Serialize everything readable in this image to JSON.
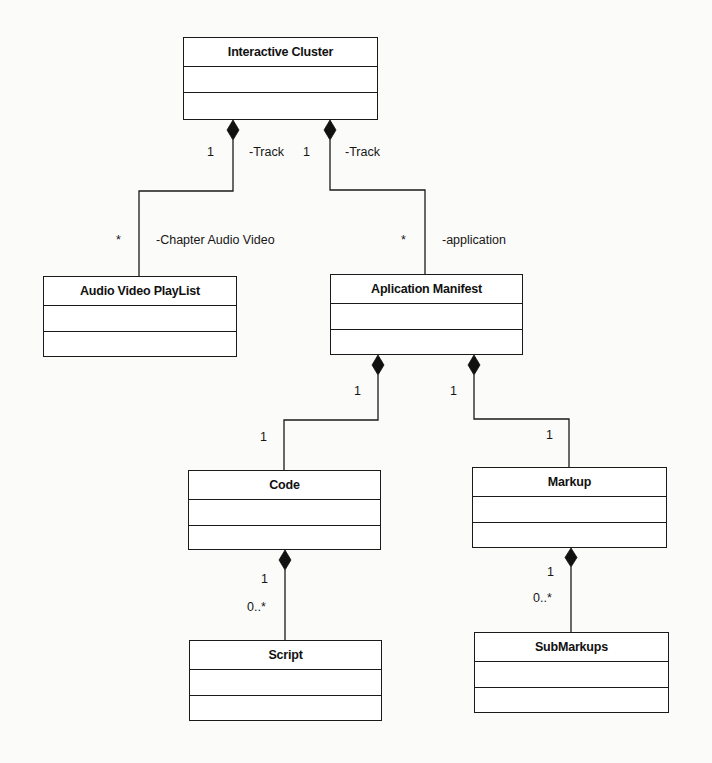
{
  "diagram": {
    "type": "UML class diagram",
    "classes": [
      {
        "id": "interactive-cluster",
        "name": "Interactive Cluster",
        "box": {
          "x": 183,
          "y": 37,
          "w": 195,
          "h": 83
        }
      },
      {
        "id": "audio-video-playlist",
        "name": "Audio Video PlayList",
        "box": {
          "x": 43,
          "y": 276,
          "w": 194,
          "h": 81
        }
      },
      {
        "id": "aplication-manifest",
        "name": "Aplication Manifest",
        "box": {
          "x": 330,
          "y": 274,
          "w": 193,
          "h": 81
        }
      },
      {
        "id": "code",
        "name": "Code",
        "box": {
          "x": 188,
          "y": 470,
          "w": 193,
          "h": 80
        }
      },
      {
        "id": "markup",
        "name": "Markup",
        "box": {
          "x": 472,
          "y": 467,
          "w": 195,
          "h": 81
        }
      },
      {
        "id": "script",
        "name": "Script",
        "box": {
          "x": 189,
          "y": 640,
          "w": 193,
          "h": 81
        }
      },
      {
        "id": "submarkups",
        "name": "SubMarkups",
        "box": {
          "x": 474,
          "y": 632,
          "w": 195,
          "h": 81
        }
      }
    ],
    "relationships": [
      {
        "type": "composition",
        "from": "Interactive Cluster",
        "to": "Audio Video PlayList",
        "source_multiplicity": "1",
        "source_role": "-Track",
        "target_multiplicity": "*",
        "target_role": "-Chapter Audio Video"
      },
      {
        "type": "composition",
        "from": "Interactive Cluster",
        "to": "Aplication Manifest",
        "source_multiplicity": "1",
        "source_role": "-Track",
        "target_multiplicity": "*",
        "target_role": "-application"
      },
      {
        "type": "composition",
        "from": "Aplication Manifest",
        "to": "Code",
        "source_multiplicity": "1",
        "target_multiplicity": "1"
      },
      {
        "type": "composition",
        "from": "Aplication Manifest",
        "to": "Markup",
        "source_multiplicity": "1",
        "target_multiplicity": "1"
      },
      {
        "type": "composition",
        "from": "Code",
        "to": "Script",
        "source_multiplicity": "1",
        "target_multiplicity": "0..*"
      },
      {
        "type": "composition",
        "from": "Markup",
        "to": "SubMarkups",
        "source_multiplicity": "1",
        "target_multiplicity": "0..*"
      }
    ],
    "labels": {
      "ic_avp_src_mult": "1",
      "ic_avp_src_role": "-Track",
      "ic_avp_tgt_mult": "*",
      "ic_avp_tgt_role": "-Chapter Audio Video",
      "ic_am_src_mult": "1",
      "ic_am_src_role": "-Track",
      "ic_am_tgt_mult": "*",
      "ic_am_tgt_role": "-application",
      "am_code_src_mult": "1",
      "am_code_tgt_mult": "1",
      "am_markup_src_mult": "1",
      "am_markup_tgt_mult": "1",
      "code_script_src_mult": "1",
      "code_script_tgt_mult": "0..*",
      "markup_sub_src_mult": "1",
      "markup_sub_tgt_mult": "0..*"
    },
    "colors": {
      "line": "#1a1a1a",
      "background": "#fbfbfa",
      "box_fill": "#ffffff"
    }
  }
}
